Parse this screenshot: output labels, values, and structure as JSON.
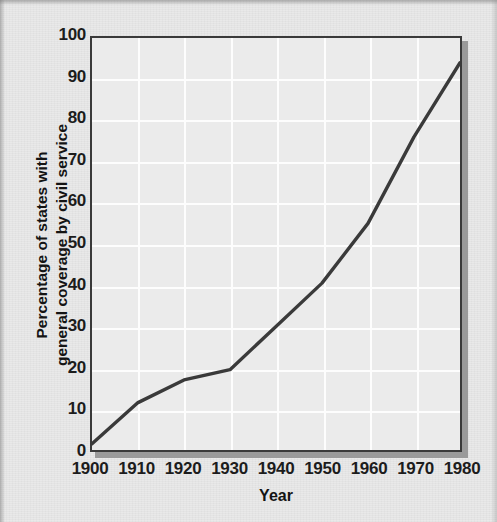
{
  "chart_data": {
    "type": "line",
    "title": "",
    "subtitle": "",
    "xlabel": "Year",
    "ylabel": "Percentage of states with general coverage by civil service",
    "ylabel_lines": [
      "Percentage of states with",
      "general coverage by civil service"
    ],
    "x": [
      1900,
      1910,
      1920,
      1930,
      1940,
      1950,
      1960,
      1970,
      1980
    ],
    "values": [
      1.5,
      11.5,
      17,
      19.5,
      30,
      40.5,
      55,
      76,
      94
    ],
    "series": [
      {
        "name": "Percentage of states with general coverage by civil service",
        "values": [
          1.5,
          11.5,
          17,
          19.5,
          30,
          40.5,
          55,
          76,
          94
        ]
      }
    ],
    "xlim": [
      1900,
      1980
    ],
    "ylim": [
      0,
      100
    ],
    "xticks": [
      1900,
      1910,
      1920,
      1930,
      1940,
      1950,
      1960,
      1970,
      1980
    ],
    "xtick_labels": [
      "1900",
      "1910",
      "1920",
      "1930",
      "1940",
      "1950",
      "1960",
      "1970",
      "1980"
    ],
    "yticks": [
      0,
      10,
      20,
      30,
      40,
      50,
      60,
      70,
      80,
      90,
      100
    ],
    "ytick_labels": [
      "0",
      "10",
      "20",
      "30",
      "40",
      "50",
      "60",
      "70",
      "80",
      "90",
      "100"
    ],
    "grid": true,
    "grid_color": "#fdfdfd",
    "legend": false,
    "legend_position": "none",
    "line_color": "#3a3a3a",
    "line_width": 3.4,
    "markers": false,
    "plot_background": "#ebebeb",
    "figure_background": "#e9e9e9",
    "axis_color": "#3a3a3a",
    "text_color": "#1c1c1c"
  }
}
